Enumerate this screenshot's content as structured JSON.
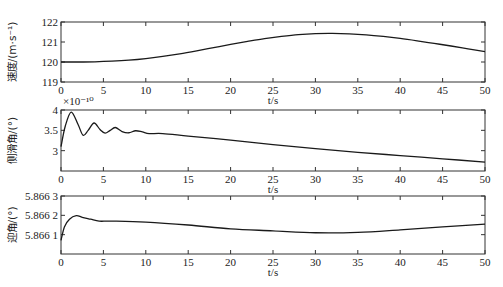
{
  "chart_data": [
    {
      "type": "line",
      "title": "",
      "xlabel": "t/s",
      "ylabel": "速度/(m·s⁻¹)",
      "xlim": [
        0,
        50
      ],
      "ylim": [
        119,
        122
      ],
      "xticks": [
        0,
        5,
        10,
        15,
        20,
        25,
        30,
        35,
        40,
        45,
        50
      ],
      "yticks": [
        "119",
        "120",
        "121",
        "122"
      ],
      "grid": false,
      "x": [
        0,
        2,
        4,
        6,
        8,
        10,
        12,
        14,
        16,
        18,
        20,
        22,
        24,
        26,
        28,
        30,
        32,
        34,
        36,
        38,
        40,
        42,
        44,
        46,
        48,
        50
      ],
      "series": [
        {
          "name": "速度",
          "values": [
            120.0,
            120.0,
            120.01,
            120.04,
            120.09,
            120.17,
            120.28,
            120.41,
            120.56,
            120.72,
            120.88,
            121.03,
            121.17,
            121.28,
            121.37,
            121.42,
            121.43,
            121.41,
            121.36,
            121.28,
            121.18,
            121.06,
            120.93,
            120.8,
            120.66,
            120.52
          ]
        }
      ]
    },
    {
      "type": "line",
      "title": "",
      "xlabel": "t/s",
      "ylabel": "侧滑角/(°)",
      "y_multiplier": "×10⁻¹⁰",
      "xlim": [
        0,
        50
      ],
      "ylim": [
        2.5,
        4
      ],
      "xticks": [
        0,
        5,
        10,
        15,
        20,
        25,
        30,
        35,
        40,
        45,
        50
      ],
      "yticks": [
        "3",
        "3.5",
        "4"
      ],
      "grid": false,
      "x": [
        0,
        0.5,
        1.2,
        2,
        2.6,
        3.2,
        3.9,
        4.6,
        5.2,
        5.8,
        6.4,
        7.2,
        8,
        8.8,
        9.6,
        10.4,
        12,
        15,
        20,
        25,
        30,
        35,
        40,
        45,
        50
      ],
      "series": [
        {
          "name": "侧滑角",
          "values": [
            3.1,
            3.6,
            3.95,
            3.65,
            3.38,
            3.5,
            3.68,
            3.52,
            3.43,
            3.5,
            3.57,
            3.47,
            3.44,
            3.49,
            3.46,
            3.42,
            3.42,
            3.36,
            3.26,
            3.15,
            3.05,
            2.96,
            2.88,
            2.8,
            2.72
          ]
        }
      ]
    },
    {
      "type": "line",
      "title": "",
      "xlabel": "t/s",
      "ylabel": "迎角/(°)",
      "xlim": [
        0,
        50
      ],
      "ylim": [
        5.866,
        5.8663
      ],
      "xticks": [
        0,
        5,
        10,
        15,
        20,
        25,
        30,
        35,
        40,
        45,
        50
      ],
      "yticks": [
        "5.866 1",
        "5.866 2",
        "5.866 3"
      ],
      "grid": false,
      "x": [
        0,
        0.4,
        1,
        1.8,
        2.5,
        3.5,
        4.5,
        6,
        10,
        15,
        20,
        25,
        30,
        35,
        40,
        45,
        50
      ],
      "series": [
        {
          "name": "迎角",
          "values": [
            5.86607,
            5.86614,
            5.86618,
            5.866198,
            5.86619,
            5.86618,
            5.86617,
            5.86617,
            5.866165,
            5.86615,
            5.86613,
            5.86612,
            5.86611,
            5.866112,
            5.866125,
            5.86614,
            5.866155
          ]
        }
      ]
    }
  ]
}
